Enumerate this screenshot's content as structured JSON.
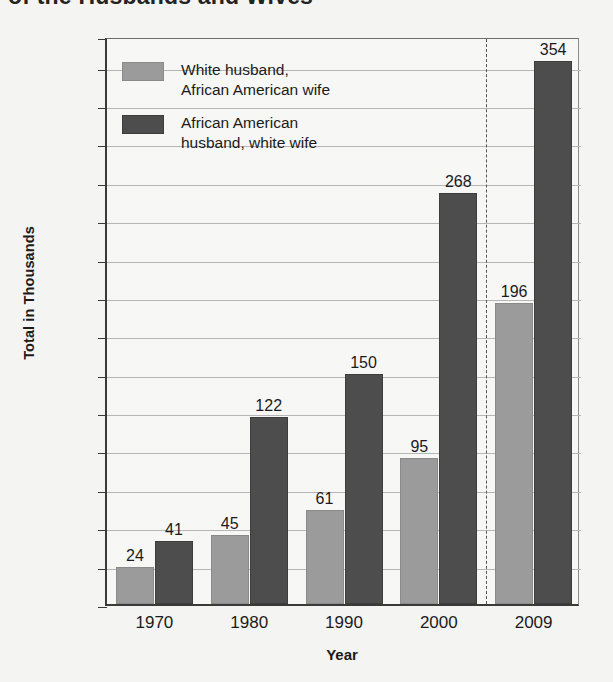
{
  "title": "of the Husbands and Wives",
  "axis": {
    "ylabel": "Total in Thousands",
    "xlabel": "Year"
  },
  "legend": {
    "items": [
      {
        "label": "White husband,\nAfrican American wife",
        "color": "#9b9b9b"
      },
      {
        "label": "African American\nhusband, white wife",
        "color": "#4d4d4d"
      }
    ]
  },
  "chart_data": {
    "type": "bar",
    "title": "of the Husbands and Wives",
    "xlabel": "Year",
    "ylabel": "Total in Thousands",
    "categories": [
      "1970",
      "1980",
      "1990",
      "2000",
      "2009"
    ],
    "series": [
      {
        "name": "White husband, African American wife",
        "color": "#9b9b9b",
        "values": [
          24,
          45,
          61,
          95,
          196
        ]
      },
      {
        "name": "African American husband, white wife",
        "color": "#4d4d4d",
        "values": [
          41,
          122,
          150,
          268,
          354
        ]
      }
    ],
    "yticks": [
      0,
      25,
      50,
      75,
      100,
      125,
      150,
      175,
      200,
      225,
      250,
      275,
      300,
      325,
      350,
      370
    ],
    "ylim": [
      0,
      370
    ],
    "grid": true,
    "legend_position": "upper-left",
    "annotations": [
      {
        "type": "vertical-dashed-line",
        "between": [
          "2000",
          "2009"
        ]
      }
    ]
  }
}
